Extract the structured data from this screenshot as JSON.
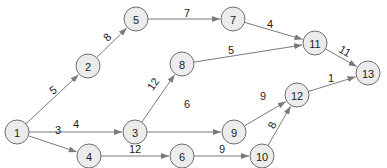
{
  "diagram": {
    "type": "directed-network",
    "node_radius": 12,
    "colors": {
      "node_fill": "#ececec",
      "node_stroke": "#6e6e6e",
      "edge": "#7a7a7a",
      "text": "#222222"
    },
    "nodes": [
      {
        "id": "1",
        "label": "1",
        "x": 17,
        "y": 132
      },
      {
        "id": "2",
        "label": "2",
        "x": 88,
        "y": 66
      },
      {
        "id": "3",
        "label": "3",
        "x": 135,
        "y": 132
      },
      {
        "id": "4",
        "label": "4",
        "x": 89,
        "y": 156
      },
      {
        "id": "5",
        "label": "5",
        "x": 136,
        "y": 19
      },
      {
        "id": "6",
        "label": "6",
        "x": 182,
        "y": 156
      },
      {
        "id": "7",
        "label": "7",
        "x": 233,
        "y": 19
      },
      {
        "id": "8",
        "label": "8",
        "x": 182,
        "y": 64
      },
      {
        "id": "9",
        "label": "9",
        "x": 234,
        "y": 132
      },
      {
        "id": "10",
        "label": "10",
        "x": 262,
        "y": 156
      },
      {
        "id": "11",
        "label": "11",
        "x": 315,
        "y": 43
      },
      {
        "id": "12",
        "label": "12",
        "x": 297,
        "y": 95
      },
      {
        "id": "13",
        "label": "13",
        "x": 368,
        "y": 73
      }
    ],
    "edges": [
      {
        "from": "1",
        "to": "2",
        "weight": "5",
        "lx": 53,
        "ly": 90,
        "rot": -35
      },
      {
        "from": "1",
        "to": "3",
        "weight": "4",
        "lx": 76,
        "ly": 124,
        "rot": 0
      },
      {
        "from": "1",
        "to": "4",
        "weight": "3",
        "lx": 58,
        "ly": 130,
        "rot": 0
      },
      {
        "from": "2",
        "to": "5",
        "weight": "8",
        "lx": 107,
        "ly": 37,
        "rot": -45
      },
      {
        "from": "5",
        "to": "7",
        "weight": "7",
        "lx": 187,
        "ly": 13,
        "rot": 0
      },
      {
        "from": "7",
        "to": "11",
        "weight": "4",
        "lx": 270,
        "ly": 24,
        "rot": 0
      },
      {
        "from": "8",
        "to": "11",
        "weight": "5",
        "lx": 231,
        "ly": 50,
        "rot": 0
      },
      {
        "from": "3",
        "to": "8",
        "weight": "12",
        "lx": 153,
        "ly": 84,
        "rot": -55
      },
      {
        "from": "3",
        "to": "9",
        "weight": "6",
        "lx": 187,
        "ly": 104,
        "rot": 0
      },
      {
        "from": "11",
        "to": "13",
        "weight": "11",
        "lx": 345,
        "ly": 51,
        "rot": 30
      },
      {
        "from": "9",
        "to": "12",
        "weight": "9",
        "lx": 263,
        "ly": 96,
        "rot": 0
      },
      {
        "from": "12",
        "to": "13",
        "weight": "1",
        "lx": 331,
        "ly": 78,
        "rot": 0
      },
      {
        "from": "4",
        "to": "6",
        "weight": "12",
        "lx": 135,
        "ly": 149,
        "rot": 0
      },
      {
        "from": "6",
        "to": "10",
        "weight": "9",
        "lx": 222,
        "ly": 149,
        "rot": 0
      },
      {
        "from": "10",
        "to": "12",
        "weight": "8",
        "lx": 272,
        "ly": 125,
        "rot": -65
      }
    ]
  }
}
